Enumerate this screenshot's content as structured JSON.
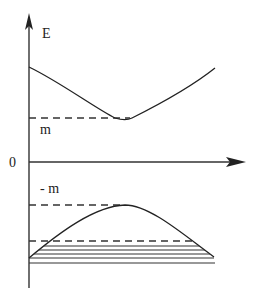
{
  "diagram": {
    "type": "energy-band-diagram",
    "labels": {
      "y_axis": "E",
      "origin": "0",
      "upper_gap": "m",
      "lower_gap": "- m"
    },
    "colors": {
      "line": "#222222",
      "background": "#ffffff"
    },
    "axes": {
      "y_axis": {
        "x": 29,
        "y_top": 15,
        "y_bottom": 288,
        "arrow": true
      },
      "x_axis": {
        "y": 162,
        "x_left": 29,
        "x_right": 245,
        "arrow": true
      }
    },
    "upper_band": {
      "description": "positive energy branch, minimum at E = m",
      "points": [
        [
          29,
          67
        ],
        [
          60,
          84
        ],
        [
          90,
          103
        ],
        [
          112,
          117
        ],
        [
          130,
          118
        ],
        [
          160,
          103
        ],
        [
          190,
          85
        ],
        [
          215,
          68
        ]
      ],
      "dashed_level_y": 118,
      "dashed_range": [
        29,
        130
      ]
    },
    "lower_band": {
      "description": "negative energy branch, maximum at E = -m, filled (Dirac sea)",
      "points": [
        [
          29,
          258
        ],
        [
          60,
          232
        ],
        [
          95,
          212
        ],
        [
          125,
          205
        ],
        [
          150,
          212
        ],
        [
          180,
          232
        ],
        [
          214,
          257
        ]
      ],
      "dashed_top_y": 205,
      "dashed_top_range": [
        29,
        125
      ],
      "dashed_fermi_y": 241,
      "dashed_fermi_range": [
        29,
        195
      ],
      "fill_lines_y": [
        246,
        250,
        254,
        258,
        263
      ]
    }
  }
}
